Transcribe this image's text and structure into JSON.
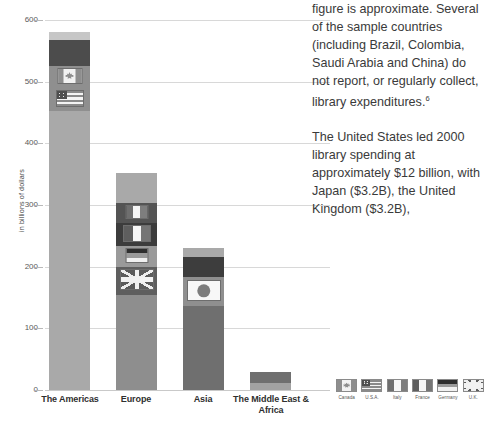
{
  "chart_data": {
    "type": "bar",
    "title": "",
    "xlabel": "",
    "ylabel": "in billions of dollars",
    "ylim": [
      0,
      600
    ],
    "yticks": [
      0,
      100,
      200,
      300,
      400,
      500,
      600
    ],
    "ytick_labels": [
      "0",
      "100",
      "200",
      "300",
      "400",
      "500",
      "600"
    ],
    "grid": true,
    "legend_position": "bottom-right",
    "categories": [
      "The Americas",
      "Europe",
      "Asia",
      "The Middle East & Africa"
    ],
    "values": [
      580,
      352,
      231,
      30
    ],
    "stacked_segments": [
      {
        "category": "The Americas",
        "total": 580,
        "segments": [
          {
            "label": "top cap",
            "value": 12,
            "flag": null,
            "color": "#c6c6c6"
          },
          {
            "label": "dark band",
            "value": 43,
            "flag": null,
            "color": "#4c4c4c"
          },
          {
            "label": "Canada",
            "value": 35,
            "flag": "canada",
            "color": "#8f8f8f"
          },
          {
            "label": "U.S.A.",
            "value": 38,
            "flag": "usa",
            "color": "#8f8f8f"
          },
          {
            "label": "base",
            "value": 452,
            "flag": null,
            "color": "#a9a9a9"
          }
        ]
      },
      {
        "category": "Europe",
        "total": 352,
        "segments": [
          {
            "label": "top cap",
            "value": 48,
            "flag": null,
            "color": "#a9a9a9"
          },
          {
            "label": "Italy",
            "value": 33,
            "flag": "italy",
            "color": "#545454"
          },
          {
            "label": "France",
            "value": 38,
            "flag": "france",
            "color": "#3c3c3c"
          },
          {
            "label": "Germany",
            "value": 33,
            "flag": "germany",
            "color": "#9a9a9a"
          },
          {
            "label": "U.K.",
            "value": 46,
            "flag": "uk",
            "color": "#5e5e5e"
          },
          {
            "label": "base",
            "value": 154,
            "flag": null,
            "color": "#8e8e8e"
          }
        ]
      },
      {
        "category": "Asia",
        "total": 231,
        "segments": [
          {
            "label": "top cap",
            "value": 15,
            "flag": null,
            "color": "#a9a9a9"
          },
          {
            "label": "dark band",
            "value": 33,
            "flag": null,
            "color": "#3d3d3d"
          },
          {
            "label": "Japan",
            "value": 47,
            "flag": "japan",
            "color": "#8f8f8f"
          },
          {
            "label": "base",
            "value": 136,
            "flag": null,
            "color": "#6f6f6f"
          }
        ]
      },
      {
        "category": "The Middle East & Africa",
        "total": 30,
        "segments": [
          {
            "label": "dark band",
            "value": 18,
            "flag": null,
            "color": "#6f6f6f"
          },
          {
            "label": "base",
            "value": 12,
            "flag": null,
            "color": "#a2a2a2"
          }
        ]
      }
    ],
    "legend": [
      {
        "label": "Canada",
        "flag": "canada"
      },
      {
        "label": "U.S.A.",
        "flag": "usa"
      },
      {
        "label": "Italy",
        "flag": "italy"
      },
      {
        "label": "France",
        "flag": "france"
      },
      {
        "label": "Germany",
        "flag": "germany"
      },
      {
        "label": "U.K.",
        "flag": "uk"
      }
    ]
  },
  "text_column": {
    "paragraph_1": "figure is approximate. Several of the sample countries (including Brazil, Colombia, Saudi Arabia and China) do not report, or regularly collect, library expenditures.",
    "footnote_marker": "6",
    "paragraph_2": "The United States led 2000 library spending at approximately $12 billion, with Japan ($3.2B), the United Kingdom ($3.2B),"
  }
}
